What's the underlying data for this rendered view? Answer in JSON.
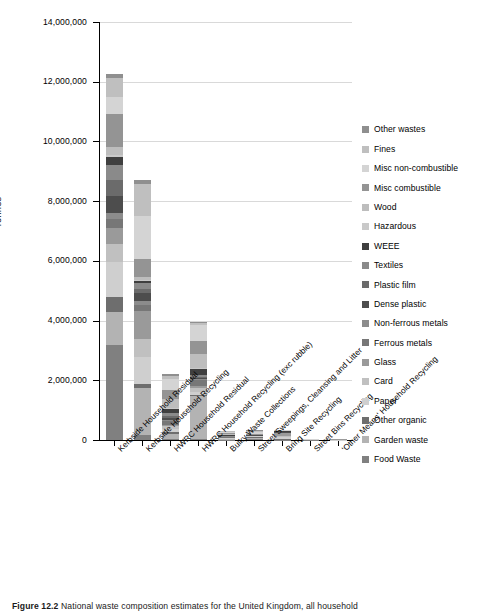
{
  "figure": {
    "caption_label": "Figure 12.2",
    "caption_text": "National waste composition estimates for the United Kingdom, all household"
  },
  "axes": {
    "ylabel": "Tonnes",
    "xlabel": "",
    "yticks": [
      "0",
      "2,000,000",
      "4,000,000",
      "6,000,000",
      "8,000,000",
      "10,000,000",
      "12,000,000",
      "14,000,000"
    ]
  },
  "chart_data": {
    "type": "bar",
    "subtype": "stacked",
    "title": "",
    "xlabel": "",
    "ylabel": "Tonnes",
    "ylim": [
      0,
      14000000
    ],
    "ytick_values": [
      0,
      2000000,
      4000000,
      6000000,
      8000000,
      10000000,
      12000000,
      14000000
    ],
    "grid": true,
    "legend_position": "right",
    "categories": [
      "Kerbside Household Residual",
      "Kerbside Household Recycling",
      "HWRC Household Residual",
      "HWRC Household Recycling (exc rubble)",
      "Bulky Waste Collections",
      "Street Sweepings, Cleansing and Litter",
      "Bring Site Recycling",
      "Street Bins Recycling",
      "'Other Means' Household Recycling"
    ],
    "series": [
      {
        "name": "Food Waste",
        "color": "#808080",
        "values": [
          3180000,
          160000,
          20000,
          25000,
          10000,
          30000,
          4000,
          3000,
          1500
        ]
      },
      {
        "name": "Garden waste",
        "color": "#b3b3b3",
        "values": [
          1100000,
          1580000,
          180000,
          1450000,
          20000,
          35000,
          12000,
          2000,
          2000
        ]
      },
      {
        "name": "Other organic",
        "color": "#6e6e6e",
        "values": [
          520000,
          130000,
          60000,
          30000,
          8000,
          40000,
          5000,
          1500,
          1000
        ]
      },
      {
        "name": "Paper",
        "color": "#cfcfcf",
        "values": [
          1150000,
          900000,
          110000,
          120000,
          15000,
          15000,
          70000,
          4000,
          8000
        ]
      },
      {
        "name": "Card",
        "color": "#c0c0c0",
        "values": [
          620000,
          620000,
          90000,
          110000,
          12000,
          10000,
          35000,
          2500,
          5000
        ]
      },
      {
        "name": "Glass",
        "color": "#9a9a9a",
        "values": [
          520000,
          920000,
          60000,
          70000,
          8000,
          8000,
          95000,
          2000,
          6000
        ]
      },
      {
        "name": "Ferrous metals",
        "color": "#777777",
        "values": [
          330000,
          230000,
          110000,
          190000,
          20000,
          6000,
          18000,
          1000,
          2500
        ]
      },
      {
        "name": "Non-ferrous metals",
        "color": "#8c8c8c",
        "values": [
          180000,
          120000,
          40000,
          45000,
          7000,
          4000,
          10000,
          800,
          1500
        ]
      },
      {
        "name": "Dense plastic",
        "color": "#4d4d4d",
        "values": [
          560000,
          260000,
          70000,
          55000,
          10000,
          8000,
          12000,
          1200,
          2500
        ]
      },
      {
        "name": "Plastic film",
        "color": "#6b6b6b",
        "values": [
          560000,
          150000,
          60000,
          30000,
          8000,
          7000,
          5000,
          1000,
          1500
        ]
      },
      {
        "name": "Textiles",
        "color": "#8a8a8a",
        "values": [
          500000,
          180000,
          110000,
          70000,
          25000,
          6000,
          22000,
          700,
          4000
        ]
      },
      {
        "name": "WEEE",
        "color": "#3f3f3f",
        "values": [
          270000,
          90000,
          120000,
          170000,
          20000,
          3000,
          6000,
          500,
          3000
        ]
      },
      {
        "name": "Hazardous",
        "color": "#c9c9c9",
        "values": [
          70000,
          25000,
          50000,
          35000,
          5000,
          2000,
          2000,
          300,
          800
        ]
      },
      {
        "name": "Wood",
        "color": "#bdbdbd",
        "values": [
          250000,
          90000,
          290000,
          490000,
          45000,
          5000,
          8000,
          400,
          3000
        ]
      },
      {
        "name": "Misc combustible",
        "color": "#949494",
        "values": [
          1100000,
          620000,
          320000,
          430000,
          40000,
          35000,
          12000,
          1500,
          5000
        ]
      },
      {
        "name": "Misc non-combustible",
        "color": "#d4d4d4",
        "values": [
          580000,
          1450000,
          370000,
          540000,
          25000,
          55000,
          9000,
          2000,
          4000
        ]
      },
      {
        "name": "Fines",
        "color": "#bfbfbf",
        "values": [
          650000,
          1050000,
          90000,
          60000,
          18000,
          45000,
          5000,
          1500,
          2000
        ]
      },
      {
        "name": "Other wastes",
        "color": "#8f8f8f",
        "values": [
          110000,
          130000,
          50000,
          40000,
          6000,
          12000,
          3000,
          600,
          1000
        ]
      }
    ],
    "legend_order_top_to_bottom": [
      "Other wastes",
      "Fines",
      "Misc non-combustible",
      "Misc combustible",
      "Wood",
      "Hazardous",
      "WEEE",
      "Textiles",
      "Plastic film",
      "Dense plastic",
      "Non-ferrous metals",
      "Ferrous metals",
      "Glass",
      "Card",
      "Paper",
      "Other organic",
      "Garden waste",
      "Food Waste"
    ],
    "category_totals": [
      12280000,
      8685000,
      2200000,
      3960000,
      302000,
      326000,
      333000,
      27500,
      54300
    ]
  }
}
